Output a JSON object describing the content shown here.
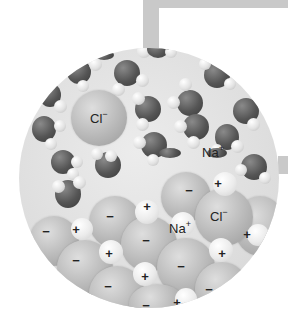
{
  "figure": {
    "labels": {
      "chloride_free": {
        "symbol": "Cl",
        "charge": "−"
      },
      "sodium_free": {
        "symbol": "Na",
        "charge": "+"
      },
      "sodium_lattice": {
        "symbol": "Na",
        "charge": "+"
      },
      "chloride_lattice": {
        "symbol": "Cl",
        "charge": "−"
      }
    },
    "lattice_signs": {
      "minus": "−",
      "plus": "+"
    },
    "colors": {
      "background": "#ffffff",
      "frame": "#c9c9c9",
      "solution": "#e0e0e0",
      "oxygen": "#555555",
      "hydrogen": "#e2e2e2",
      "chloride_ion": "#b8b8b8",
      "sodium_ion": "#ebebeb"
    }
  }
}
